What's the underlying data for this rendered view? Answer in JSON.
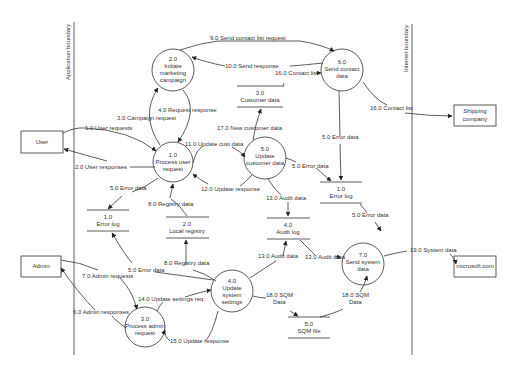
{
  "boundaries": {
    "application": "Application boundary",
    "internet": "Internet boundary"
  },
  "entities": {
    "user": "User",
    "admin": "Admin",
    "shipping": [
      "Shipping",
      "company"
    ],
    "microsoft": "microsoft.com"
  },
  "processes": {
    "p1": [
      "1.0",
      "Process user",
      "request"
    ],
    "p2": [
      "2.0",
      "Initiate",
      "marketing",
      "campaign"
    ],
    "p3": [
      "3.0",
      "Process admin",
      "request"
    ],
    "p4": [
      "4.0",
      "Update",
      "system",
      "settings"
    ],
    "p5": [
      "5.0",
      "Update",
      "customer data"
    ],
    "p6": [
      "6.0",
      "Send contact",
      "data"
    ],
    "p7": [
      "7.0",
      "Send system",
      "data"
    ]
  },
  "stores": {
    "s1": [
      "1.0",
      "Error log"
    ],
    "s2": [
      "2.0",
      "Local registry"
    ],
    "s3": [
      "3.0",
      "Customer data"
    ],
    "s4": [
      "4.0",
      "Audit log"
    ],
    "s5": [
      "5.0",
      "SQM file"
    ],
    "s1b": [
      "1.0",
      "Error log"
    ]
  },
  "flows": {
    "f1": "1.0 User requests",
    "f2": "2.0 User responses",
    "f3": "3.0 Campaign request",
    "f4": "4.0 Request response",
    "f5a": "5.0 Error data",
    "f5b": "5.0 Error data",
    "f5c": "5.0 Error data",
    "f5d": "5.0 Error data",
    "f5e": "5.0 Error data",
    "f6": "6.0 Admin responses",
    "f7": "7.0 Admin requests",
    "f8a": "8.0 Registry data",
    "f8b": "8.0 Registry data",
    "f9": "9.0 Send contact list request",
    "f10": "10.0 Send response",
    "f11": "11.0 Update cust data",
    "f12": "12.0 Update response",
    "f13a": "13.0 Audit data",
    "f13b": "13.0 Audit data",
    "f13c": "13.0 Audit data",
    "f14": "14.0 Update settings req",
    "f15": "15.0 Update response",
    "f16a": "16.0 Contact list",
    "f16b": "16.0 Contact list",
    "f17": "17.0 New customer data",
    "f18a": [
      "18.0 SQM",
      "Data"
    ],
    "f18b": [
      "18.0 SQM",
      "Data"
    ],
    "f19": "19.0 System data"
  }
}
